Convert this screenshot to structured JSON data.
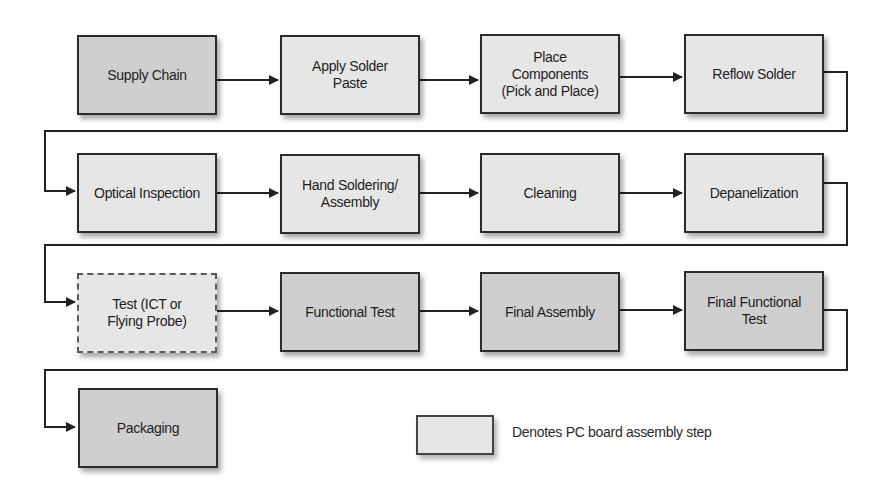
{
  "diagram": {
    "type": "process-flowchart",
    "colors": {
      "pcb_step_fill": "#e6e6e6",
      "other_step_fill": "#cfcfcf",
      "border": "#2b2b2b",
      "connector": "#222222"
    },
    "rows": [
      {
        "steps": [
          {
            "label": "Supply Chain",
            "kind": "other"
          },
          {
            "label": "Apply Solder\nPaste",
            "kind": "pcb"
          },
          {
            "label": "Place\nComponents\n(Pick and Place)",
            "kind": "pcb"
          },
          {
            "label": "Reflow Solder",
            "kind": "pcb"
          }
        ]
      },
      {
        "steps": [
          {
            "label": "Optical Inspection",
            "kind": "pcb"
          },
          {
            "label": "Hand Soldering/\nAssembly",
            "kind": "pcb"
          },
          {
            "label": "Cleaning",
            "kind": "pcb"
          },
          {
            "label": "Depanelization",
            "kind": "pcb"
          }
        ]
      },
      {
        "steps": [
          {
            "label": "Test (ICT or\nFlying Probe)",
            "kind": "pcb",
            "border": "dashed"
          },
          {
            "label": "Functional Test",
            "kind": "other"
          },
          {
            "label": "Final Assembly",
            "kind": "other"
          },
          {
            "label": "Final Functional\nTest",
            "kind": "other"
          }
        ]
      },
      {
        "steps": [
          {
            "label": "Packaging",
            "kind": "other"
          }
        ]
      }
    ],
    "legend": {
      "label": "Denotes PC board assembly step",
      "swatch_kind": "pcb"
    }
  }
}
